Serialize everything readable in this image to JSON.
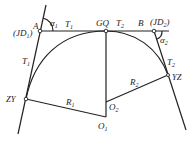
{
  "diagram": {
    "type": "compound-curve-geometry",
    "points": {
      "A": {
        "label": "A",
        "alt_label": "(JD1)",
        "x": 40,
        "y": 31
      },
      "GQ": {
        "label": "GQ",
        "x": 106,
        "y": 31
      },
      "B": {
        "label": "B",
        "alt_label": "(JD2)",
        "x": 154,
        "y": 31
      },
      "ZY": {
        "label": "ZY",
        "x": 26,
        "y": 99
      },
      "YZ": {
        "label": "YZ",
        "x": 168,
        "y": 75
      },
      "O1": {
        "label": "O1",
        "x": 106,
        "y": 117
      },
      "O2": {
        "label": "O2",
        "x": 106,
        "y": 102
      }
    },
    "labels": {
      "A": "A",
      "JD1": "(JD",
      "JD1_sub": "1",
      "JD1_close": ")",
      "alpha1": "α",
      "alpha1_sub": "1",
      "T1_top": "T",
      "T1_top_sub": "1",
      "T1_left": "T",
      "T1_left_sub": "1",
      "GQ": "GQ",
      "T2_top": "T",
      "T2_top_sub": "2",
      "B": "B",
      "JD2": "(JD",
      "JD2_sub": "2",
      "JD2_close": ")",
      "alpha2": "α",
      "alpha2_sub": "2",
      "T2_right": "T",
      "T2_right_sub": "2",
      "ZY": "ZY",
      "YZ": "YZ",
      "R1": "R",
      "R1_sub": "1",
      "R2": "R",
      "R2_sub": "2",
      "O1": "O",
      "O1_sub": "1",
      "O2": "O",
      "O2_sub": "2"
    }
  }
}
